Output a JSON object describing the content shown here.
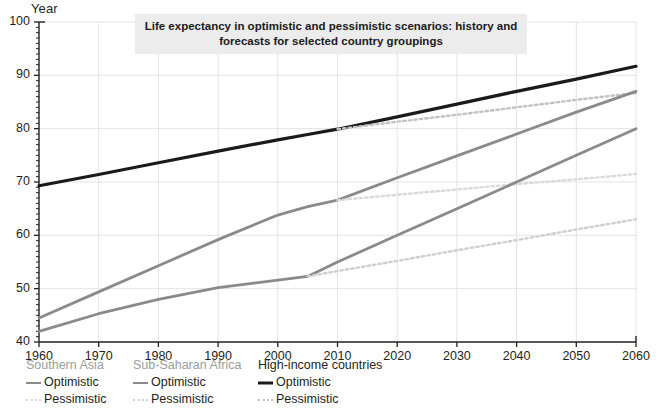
{
  "axis_title": "Year",
  "title": "Life expectancy in optimistic and pessimistic scenarios: history and forecasts for selected country groupings",
  "colors": {
    "high_income_optimistic": "#1a1a1a",
    "high_income_pessimistic": "#c2c2c2",
    "southern_asia_optimistic": "#8a8a8a",
    "southern_asia_pessimistic": "#d9d9d9",
    "sub_saharan_optimistic": "#8a8a8a",
    "sub_saharan_pessimistic": "#cfcfcf",
    "title_background": "#ececec",
    "gridline": "#e3e3e3",
    "axis": "#231f20"
  },
  "legend": {
    "groups": [
      {
        "name": "Southern Asia",
        "header_style": "light",
        "entries": [
          {
            "label": "Optimistic",
            "style": "solid-grey"
          },
          {
            "label": "Pessimistic",
            "style": "dot-lightest"
          }
        ]
      },
      {
        "name": "Sub-Saharan Africa",
        "header_style": "light",
        "entries": [
          {
            "label": "Optimistic",
            "style": "solid-grey"
          },
          {
            "label": "Pessimistic",
            "style": "dot-light"
          }
        ]
      },
      {
        "name": "High-income countries",
        "header_style": "dark",
        "entries": [
          {
            "label": "Optimistic",
            "style": "solid-black"
          },
          {
            "label": "Pessimistic",
            "style": "dot-mid"
          }
        ]
      }
    ]
  },
  "chart_data": {
    "type": "line",
    "title": "Life expectancy in optimistic and pessimistic scenarios: history and forecasts for selected country groupings",
    "xlabel": "",
    "ylabel": "Year",
    "xlim": [
      1960,
      2060
    ],
    "ylim": [
      40,
      100
    ],
    "xticks": [
      1960,
      1970,
      1980,
      1990,
      2000,
      2010,
      2020,
      2030,
      2040,
      2050,
      2060
    ],
    "yticks": [
      40,
      50,
      60,
      70,
      80,
      90,
      100
    ],
    "grid": true,
    "minor_ticks_axis": "y",
    "legend_position": "below-axis",
    "series": [
      {
        "name": "High-income countries — Optimistic",
        "group": "High-income countries",
        "scenario": "Optimistic",
        "style": "solid",
        "color": "#1a1a1a",
        "width": 3.2,
        "x": [
          1960,
          1970,
          1980,
          1990,
          2000,
          2005,
          2010,
          2020,
          2030,
          2040,
          2050,
          2060
        ],
        "y": [
          69.3,
          71.4,
          73.6,
          75.8,
          77.9,
          78.9,
          79.9,
          82.2,
          84.6,
          87.0,
          89.3,
          91.7
        ]
      },
      {
        "name": "High-income countries — Pessimistic",
        "group": "High-income countries",
        "scenario": "Pessimistic",
        "style": "dotted",
        "color": "#c2c2c2",
        "width": 2.4,
        "x": [
          2010,
          2020,
          2030,
          2040,
          2050,
          2060
        ],
        "y": [
          79.9,
          81.3,
          82.6,
          84.0,
          85.4,
          86.7
        ]
      },
      {
        "name": "Southern Asia — Optimistic",
        "group": "Southern Asia",
        "scenario": "Optimistic",
        "style": "solid",
        "color": "#8a8a8a",
        "width": 2.8,
        "x": [
          1960,
          1970,
          1980,
          1990,
          2000,
          2005,
          2010,
          2020,
          2030,
          2040,
          2050,
          2060
        ],
        "y": [
          44.5,
          49.4,
          54.3,
          59.2,
          63.8,
          65.4,
          66.6,
          70.8,
          74.9,
          79.0,
          83.1,
          87.0
        ]
      },
      {
        "name": "Southern Asia — Pessimistic",
        "group": "Southern Asia",
        "scenario": "Pessimistic",
        "style": "dotted",
        "color": "#d9d9d9",
        "width": 2.4,
        "x": [
          2010,
          2020,
          2030,
          2040,
          2050,
          2060
        ],
        "y": [
          66.6,
          67.6,
          68.6,
          69.6,
          70.5,
          71.5
        ]
      },
      {
        "name": "Sub-Saharan Africa — Optimistic",
        "group": "Sub-Saharan Africa",
        "scenario": "Optimistic",
        "style": "solid",
        "color": "#8a8a8a",
        "width": 2.8,
        "x": [
          1960,
          1970,
          1980,
          1990,
          2000,
          2005,
          2010,
          2020,
          2030,
          2040,
          2050,
          2060
        ],
        "y": [
          42.0,
          45.3,
          48.0,
          50.2,
          51.6,
          52.3,
          55.0,
          60.0,
          65.0,
          70.0,
          75.0,
          80.0
        ]
      },
      {
        "name": "Sub-Saharan Africa — Pessimistic",
        "group": "Sub-Saharan Africa",
        "scenario": "Pessimistic",
        "style": "dotted",
        "color": "#cfcfcf",
        "width": 2.4,
        "x": [
          2005,
          2010,
          2020,
          2030,
          2040,
          2050,
          2060
        ],
        "y": [
          52.3,
          53.3,
          55.2,
          57.2,
          59.1,
          61.1,
          63.0
        ]
      }
    ]
  }
}
